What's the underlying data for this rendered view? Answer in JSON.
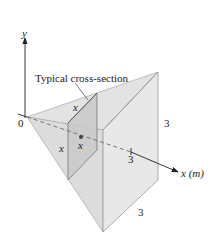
{
  "diagram": {
    "type": "3d-solid",
    "axes": {
      "y_label": "y",
      "x_label": "x (m)",
      "origin_label": "0"
    },
    "labels": {
      "cross_section": "Typical cross-section",
      "cross_side_top": "x",
      "cross_side_left": "x",
      "cross_position": "x",
      "base_height": "3",
      "base_width": "3",
      "x_tick": "3"
    },
    "colors": {
      "solid_face_light": "#e6e6e6",
      "solid_face_mid": "#d9d9d9",
      "cross_section_fill": "#c8c8c8",
      "edge": "#9a9a9a",
      "axis": "#222222"
    }
  }
}
